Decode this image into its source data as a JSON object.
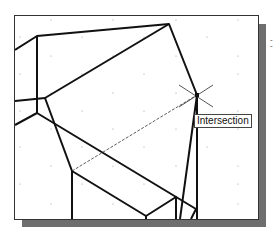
{
  "canvas": {
    "snap_label": "Intersection",
    "grid": "on",
    "cursor": "crosshair-x"
  },
  "side_marks": [
    "-",
    "-"
  ]
}
